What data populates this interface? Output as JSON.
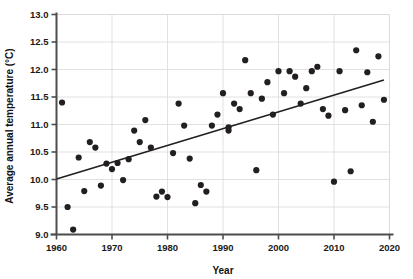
{
  "chart_data": {
    "type": "scatter",
    "title": "",
    "xlabel": "Year",
    "ylabel": "Average annual temperature (°C)",
    "xlim": [
      1960,
      2020
    ],
    "ylim": [
      9.0,
      13.0
    ],
    "xticks": [
      1960,
      1970,
      1980,
      1990,
      2000,
      2010,
      2020
    ],
    "xtick_labels": [
      "1960",
      "1970",
      "1980",
      "1990",
      "2000",
      "2010",
      "2020"
    ],
    "yticks": [
      9.0,
      9.5,
      10.0,
      10.5,
      11.0,
      11.5,
      12.0,
      12.5,
      13.0
    ],
    "ytick_labels": [
      "9.0",
      "9.5",
      "10.0",
      "10.5",
      "11.0",
      "11.5",
      "12.0",
      "12.5",
      "13.0"
    ],
    "grid": true,
    "grid_color": "#d9d9d9",
    "legend": null,
    "marker_color": "#231f20",
    "marker_size": 3.1,
    "series": [
      {
        "name": "Average annual temperature",
        "points": [
          [
            1961,
            11.4
          ],
          [
            1962,
            9.5
          ],
          [
            1963,
            9.09
          ],
          [
            1964,
            10.4
          ],
          [
            1965,
            9.79
          ],
          [
            1966,
            10.68
          ],
          [
            1967,
            10.58
          ],
          [
            1968,
            9.89
          ],
          [
            1969,
            10.29
          ],
          [
            1970,
            10.19
          ],
          [
            1971,
            10.3
          ],
          [
            1972,
            9.99
          ],
          [
            1973,
            10.37
          ],
          [
            1974,
            10.89
          ],
          [
            1975,
            10.68
          ],
          [
            1976,
            11.08
          ],
          [
            1977,
            10.58
          ],
          [
            1978,
            9.69
          ],
          [
            1979,
            9.78
          ],
          [
            1980,
            9.68
          ],
          [
            1981,
            10.48
          ],
          [
            1982,
            11.38
          ],
          [
            1983,
            10.98
          ],
          [
            1984,
            10.38
          ],
          [
            1985,
            9.57
          ],
          [
            1986,
            9.9
          ],
          [
            1987,
            9.78
          ],
          [
            1988,
            10.98
          ],
          [
            1989,
            11.18
          ],
          [
            1990,
            11.57
          ],
          [
            1991,
            10.89
          ],
          [
            1991,
            10.95
          ],
          [
            1992,
            11.38
          ],
          [
            1993,
            11.28
          ],
          [
            1994,
            12.17
          ],
          [
            1995,
            11.57
          ],
          [
            1996,
            10.17
          ],
          [
            1997,
            11.47
          ],
          [
            1998,
            11.77
          ],
          [
            1999,
            11.18
          ],
          [
            2000,
            11.97
          ],
          [
            2001,
            11.57
          ],
          [
            2002,
            11.97
          ],
          [
            2003,
            11.87
          ],
          [
            2004,
            11.38
          ],
          [
            2005,
            11.66
          ],
          [
            2006,
            11.97
          ],
          [
            2007,
            12.05
          ],
          [
            2008,
            11.28
          ],
          [
            2009,
            11.16
          ],
          [
            2010,
            9.96
          ],
          [
            2011,
            11.97
          ],
          [
            2012,
            11.26
          ],
          [
            2013,
            10.15
          ],
          [
            2014,
            12.35
          ],
          [
            2015,
            11.35
          ],
          [
            2016,
            11.95
          ],
          [
            2017,
            11.05
          ],
          [
            2018,
            12.24
          ],
          [
            2019,
            11.45
          ]
        ]
      }
    ],
    "trendline": {
      "name": "linear-trend",
      "x": [
        1960,
        2019
      ],
      "y": [
        10.01,
        11.81
      ],
      "color": "#231f20",
      "width": 1.6
    }
  },
  "axes": {
    "x_axis_color": "#4d4d4d",
    "y_axis_color": "#4d4d4d"
  }
}
